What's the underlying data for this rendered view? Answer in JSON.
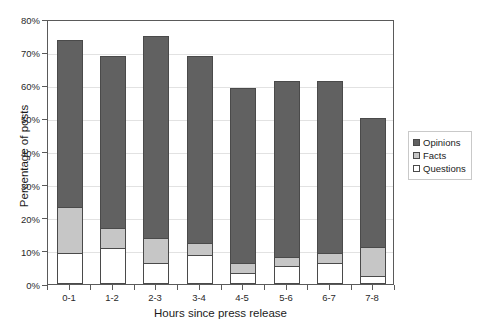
{
  "chart_data": {
    "type": "bar",
    "stacked": true,
    "title": "",
    "xlabel": "Hours since press release",
    "ylabel": "Percentage of posts",
    "categories": [
      "0-1",
      "1-2",
      "2-3",
      "3-4",
      "4-5",
      "5-6",
      "6-7",
      "7-8"
    ],
    "series": [
      {
        "name": "Questions",
        "color": "#ffffff",
        "values": [
          9,
          10.5,
          6,
          8.5,
          3,
          5,
          6,
          2
        ]
      },
      {
        "name": "Facts",
        "color": "#c6c6c6",
        "values": [
          14,
          6,
          7.5,
          3.5,
          3,
          3,
          3,
          9
        ]
      },
      {
        "name": "Opinions",
        "color": "#616161",
        "values": [
          50.5,
          52,
          61,
          56.5,
          53,
          53,
          52,
          38.8
        ]
      }
    ],
    "totals": [
      73.5,
      68.5,
      74.5,
      68.5,
      59,
      61,
      61,
      49.8
    ],
    "ylim": [
      0,
      80
    ],
    "yticks": [
      0,
      10,
      20,
      30,
      40,
      50,
      60,
      70,
      80
    ],
    "ytick_labels": [
      "0%",
      "10%",
      "20%",
      "30%",
      "40%",
      "50%",
      "60%",
      "70%",
      "80%"
    ],
    "grid": true,
    "legend_position": "right",
    "legend_entries": [
      "Opinions",
      "Facts",
      "Questions"
    ]
  }
}
